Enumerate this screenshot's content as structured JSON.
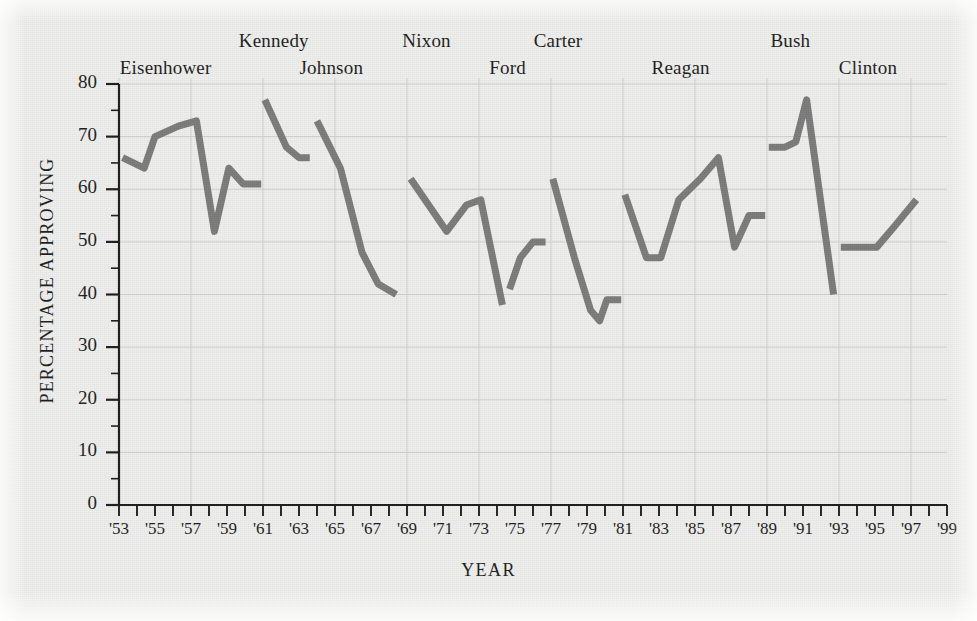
{
  "chart_data": {
    "type": "line",
    "title": "",
    "xlabel": "YEAR",
    "ylabel": "PERCENTAGE APPROVING",
    "xlim": [
      1953,
      1999
    ],
    "ylim": [
      0,
      80
    ],
    "y_ticks": [
      0,
      10,
      20,
      30,
      40,
      50,
      60,
      70,
      80
    ],
    "y_minor_step": 5,
    "x_ticks": [
      "'53",
      "'55",
      "'57",
      "'59",
      "'61",
      "'63",
      "'65",
      "'67",
      "'69",
      "'71",
      "'73",
      "'75",
      "'77",
      "'79",
      "'81",
      "'83",
      "'85",
      "'87",
      "'89",
      "'91",
      "'93",
      "'95",
      "'97",
      "'99"
    ],
    "x_tick_years": [
      1953,
      1955,
      1957,
      1959,
      1961,
      1963,
      1965,
      1967,
      1969,
      1971,
      1973,
      1975,
      1977,
      1979,
      1981,
      1983,
      1985,
      1987,
      1989,
      1991,
      1993,
      1995,
      1997,
      1999
    ],
    "x_minor_step": 1,
    "grid": true,
    "grid_x_step": 4,
    "grid_y_step": 10,
    "line_color": "#7b7b7b",
    "line_width": 7,
    "legend": "none",
    "series": [
      {
        "name": "Eisenhower",
        "label_x": 1955.6,
        "label_row": 1,
        "x": [
          1953.2,
          1954.4,
          1955.0,
          1956.3,
          1957.3,
          1958.3,
          1959.1,
          1959.9,
          1960.9
        ],
        "values": [
          66,
          64,
          70,
          72,
          73,
          52,
          64,
          61,
          61
        ]
      },
      {
        "name": "Kennedy",
        "label_x": 1961.6,
        "label_row": 0,
        "x": [
          1961.1,
          1962.3,
          1963.0,
          1963.6
        ],
        "values": [
          77,
          68,
          66,
          66
        ]
      },
      {
        "name": "Johnson",
        "label_x": 1964.8,
        "label_row": 1,
        "x": [
          1964.0,
          1965.3,
          1966.5,
          1967.4,
          1968.4
        ],
        "values": [
          73,
          64,
          48,
          42,
          40
        ]
      },
      {
        "name": "Nixon",
        "label_x": 1970.1,
        "label_row": 0,
        "x": [
          1969.2,
          1970.2,
          1971.2,
          1972.3,
          1973.1,
          1974.3
        ],
        "values": [
          62,
          57,
          52,
          57,
          58,
          38
        ]
      },
      {
        "name": "Ford",
        "label_x": 1974.6,
        "label_row": 1,
        "x": [
          1974.7,
          1975.3,
          1976.0,
          1976.7
        ],
        "values": [
          41,
          47,
          50,
          50
        ]
      },
      {
        "name": "Carter",
        "label_x": 1977.4,
        "label_row": 0,
        "x": [
          1977.1,
          1978.3,
          1979.2,
          1979.7,
          1980.1,
          1980.9
        ],
        "values": [
          62,
          47,
          37,
          35,
          39,
          39
        ]
      },
      {
        "name": "Reagan",
        "label_x": 1984.2,
        "label_row": 1,
        "x": [
          1981.1,
          1982.3,
          1983.1,
          1984.1,
          1985.3,
          1986.3,
          1987.2,
          1988.0,
          1988.9
        ],
        "values": [
          59,
          47,
          47,
          58,
          62,
          66,
          49,
          55,
          55
        ]
      },
      {
        "name": "Bush",
        "label_x": 1990.3,
        "label_row": 0,
        "x": [
          1989.1,
          1990.0,
          1990.6,
          1991.2,
          1992.7
        ],
        "values": [
          68,
          68,
          69,
          77,
          40
        ]
      },
      {
        "name": "Clinton",
        "label_x": 1994.6,
        "label_row": 1,
        "x": [
          1993.1,
          1994.3,
          1995.1,
          1996.1,
          1997.3
        ],
        "values": [
          49,
          49,
          49,
          53,
          58
        ]
      }
    ]
  }
}
